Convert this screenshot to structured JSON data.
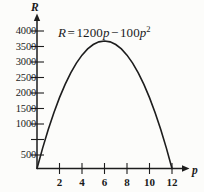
{
  "chart_data": {
    "type": "line",
    "title": "",
    "equation_label": {
      "lhs": "R",
      "equals": "=",
      "coefficient_linear": "1200",
      "var_linear": "p",
      "minus": "−",
      "coefficient_square": "100",
      "var_square": "p",
      "exponent": "2",
      "plain": "R = 1200p − 100p²"
    },
    "xlabel": "p",
    "ylabel": "R",
    "xlim": [
      0,
      12.9
    ],
    "ylim": [
      0,
      4300
    ],
    "xticks": [
      2,
      4,
      6,
      8,
      10,
      12
    ],
    "xtick_labels": [
      "2",
      "4",
      "6",
      "8",
      "10",
      "12"
    ],
    "yticks": [
      500,
      1000,
      1500,
      2000,
      2500,
      3000,
      3500,
      4000
    ],
    "ytick_labels": [
      "500",
      "1000",
      "1500",
      "2000",
      "2500",
      "3000",
      "3500",
      "4000"
    ],
    "grid": false,
    "legend": false,
    "curve_color": "#1d1d1d",
    "axis_color": "#1d1d1d",
    "background_color": "#fcfcfa",
    "roots": [
      0,
      12
    ],
    "vertex": {
      "p": 6,
      "R": 3600
    },
    "x": [
      0,
      0.5,
      1,
      1.5,
      2,
      2.5,
      3,
      3.5,
      4,
      4.5,
      5,
      5.5,
      6,
      6.5,
      7,
      7.5,
      8,
      8.5,
      9,
      9.5,
      10,
      10.5,
      11,
      11.5,
      12
    ],
    "values": [
      0,
      575,
      1100,
      1575,
      2000,
      2375,
      2700,
      2975,
      3200,
      3375,
      3500,
      3575,
      3600,
      3575,
      3500,
      3375,
      3200,
      2975,
      2700,
      2375,
      2000,
      1575,
      1100,
      575,
      0
    ]
  }
}
